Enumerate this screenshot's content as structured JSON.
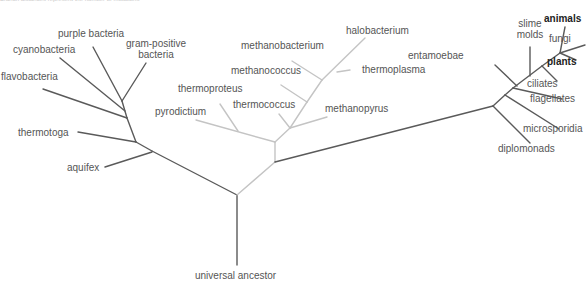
{
  "caption": "Branch distances represent the number of mutations",
  "colors": {
    "bacteria": "#5a5a5a",
    "archaea": "#c4c4c4",
    "eukaryotes": "#5a5a5a"
  },
  "labels": {
    "purple_bacteria": "purple bacteria",
    "cyanobacteria": "cyanobacteria",
    "gram_positive_1": "gram-positive",
    "gram_positive_2": "bacteria",
    "flavobacteria": "flavobacteria",
    "thermotoga": "thermotoga",
    "aquifex": "aquifex",
    "halobacterium": "halobacterium",
    "methanobacterium": "methanobacterium",
    "thermoplasma": "thermoplasma",
    "methanococcus": "methanococcus",
    "thermoproteus": "thermoproteus",
    "pyrodictium": "pyrodictium",
    "thermococcus": "thermococcus",
    "methanopyrus": "methanopyrus",
    "slime_molds_1": "slime",
    "slime_molds_2": "molds",
    "animals": "animals",
    "fungi": "fungi",
    "plants": "plants",
    "entamoebae": "entamoebae",
    "ciliates": "ciliates",
    "flagellates": "flagellates",
    "microsporidia": "microsporidia",
    "diplomonads": "diplomonads",
    "universal_ancestor": "universal ancestor"
  }
}
